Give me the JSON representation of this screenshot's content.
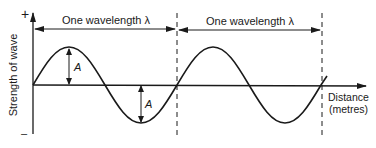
{
  "diagram": {
    "y_axis": {
      "label": "Strength of wave",
      "positive_mark": "+",
      "negative_mark": "–"
    },
    "x_axis": {
      "label_line1": "Distance",
      "label_line2": "(metres)"
    },
    "wavelength_labels": [
      {
        "text": "One wavelength λ"
      },
      {
        "text": "One wavelength λ"
      }
    ],
    "amplitude_labels": [
      {
        "text": "A"
      },
      {
        "text": "A"
      }
    ],
    "colors": {
      "ink": "#1a1a1a",
      "background": "#ffffff"
    }
  }
}
